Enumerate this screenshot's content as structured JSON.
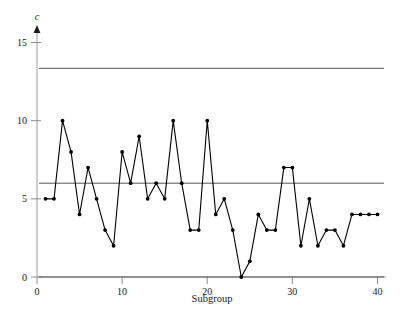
{
  "chart_data": {
    "type": "line",
    "title": "",
    "xlabel": "Subgroup",
    "ylabel": "c",
    "xlim": [
      0,
      41
    ],
    "ylim": [
      0,
      15.8
    ],
    "grid": false,
    "legend": "none",
    "x": [
      1,
      2,
      3,
      4,
      5,
      6,
      7,
      8,
      9,
      10,
      11,
      12,
      13,
      14,
      15,
      16,
      17,
      18,
      19,
      20,
      21,
      22,
      23,
      24,
      25,
      26,
      27,
      28,
      29,
      30,
      31,
      32,
      33,
      34,
      35,
      36,
      37,
      38,
      39,
      40
    ],
    "values": [
      5,
      5,
      10,
      8,
      4,
      7,
      5,
      3,
      2,
      8,
      6,
      9,
      5,
      6,
      5,
      10,
      6,
      3,
      3,
      10,
      4,
      5,
      3,
      0,
      1,
      4,
      3,
      3,
      7,
      7,
      2,
      5,
      2,
      3,
      3,
      2,
      4,
      4,
      4,
      4
    ],
    "series": [
      {
        "name": "c",
        "values": [
          5,
          5,
          10,
          8,
          4,
          7,
          5,
          3,
          2,
          8,
          6,
          9,
          5,
          6,
          5,
          10,
          6,
          3,
          3,
          10,
          4,
          5,
          3,
          0,
          1,
          4,
          3,
          3,
          7,
          7,
          2,
          5,
          2,
          3,
          3,
          2,
          4,
          4,
          4,
          4
        ]
      }
    ],
    "xticks": [
      0,
      10,
      20,
      30,
      40
    ],
    "xtick_labels": [
      "0",
      "10",
      "20",
      "30",
      "40"
    ],
    "yticks": [
      0,
      5,
      10,
      15
    ],
    "ytick_labels": [
      "0",
      "5",
      "10",
      "15"
    ],
    "reference_lines": [
      {
        "name": "UCL",
        "value": 13.35,
        "label": ""
      },
      {
        "name": "CL",
        "value": 6.0,
        "label": ""
      },
      {
        "name": "LCL",
        "value": 0.0,
        "label": ""
      }
    ],
    "marker": "filled-circle",
    "line_color": "#000000",
    "limit_line_color": "#555555",
    "axis_color": "#999999",
    "background": "#ffffff"
  }
}
